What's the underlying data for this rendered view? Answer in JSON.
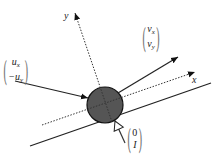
{
  "diagram": {
    "title": "",
    "type": "collision-of-ball-with-wall",
    "colors": {
      "ball_fill": "#555555",
      "ball_stroke": "#111111",
      "line": "#222222",
      "axis": "#333333",
      "background": "#ffffff"
    },
    "axes": {
      "x_label": "x",
      "y_label": "y",
      "style": "dotted"
    },
    "ball": {
      "shape": "circle",
      "center": [
        105,
        105
      ],
      "radius": 18
    },
    "wall": {
      "from": [
        30,
        146
      ],
      "to": [
        211,
        83
      ],
      "style": "solid"
    },
    "vectors": {
      "incoming": {
        "name": "incoming-velocity",
        "top": "u",
        "top_sub": "x",
        "bottom": "−u",
        "bottom_sub": "y"
      },
      "outgoing": {
        "name": "outgoing-velocity",
        "top": "v",
        "top_sub": "x",
        "bottom": "v",
        "bottom_sub": "y"
      },
      "impulse": {
        "name": "impulse",
        "top": "0",
        "bottom": "I"
      }
    },
    "icons": {
      "arrow_in": "solid-arrow-icon",
      "arrow_out": "solid-arrow-icon",
      "impulse_arrow": "hollow-arrow-icon"
    }
  }
}
